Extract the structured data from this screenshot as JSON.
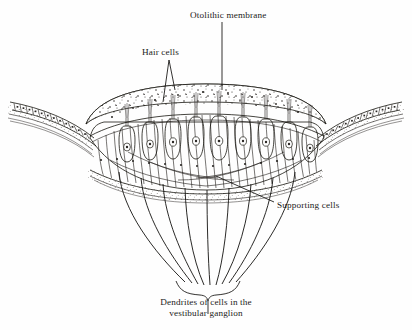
{
  "figure": {
    "background_color": "#fefefe",
    "ink_color": "#17150f",
    "labels": {
      "otolithic_membrane": "Otolithic membrane",
      "hair_cells": "Hair cells",
      "supporting_cells": "Supporting cells",
      "dendrites": "Dendrites of cells in the vestibular ganglion"
    },
    "structures": [
      {
        "name": "otolithic-membrane",
        "description": "stippled dome-shaped gelatinous cap containing otoliths"
      },
      {
        "name": "hair-cell",
        "description": "flask-shaped sensory cell with round nucleus and apical stereocilia bundle"
      },
      {
        "name": "supporting-cell",
        "description": "slender columnar cell between hair cells"
      },
      {
        "name": "cuboidal-epithelium",
        "description": "simple cuboidal cells flanking the macula"
      },
      {
        "name": "basement-membrane",
        "description": "stippled basal layer beneath the sensory epithelium"
      },
      {
        "name": "nerve-fiber",
        "description": "dendrite running from hair cell base toward the vestibular ganglion"
      },
      {
        "name": "convergence-brace",
        "description": "brace where nerve fibers bundle together"
      }
    ],
    "counts": {
      "hair_cells": 9,
      "nerve_fibers": 9,
      "left_epithelial_cells": 13,
      "right_epithelial_cells": 13
    }
  }
}
